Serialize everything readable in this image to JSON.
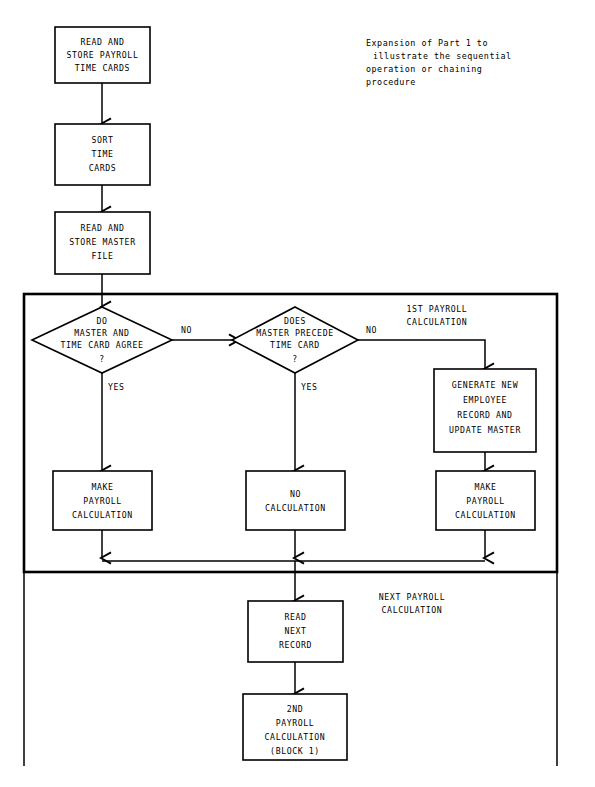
{
  "page": {
    "width": 595,
    "height": 787,
    "background_color": "#ffffff",
    "ink_color": "#000000"
  },
  "note": {
    "lines": [
      "Expansion of Part 1 to",
      "illustrate the sequential",
      "operation or chaining",
      "procedure"
    ]
  },
  "sections": [
    {
      "id": "first-payroll",
      "label_lines": [
        "1ST PAYROLL",
        "CALCULATION"
      ]
    },
    {
      "id": "next-payroll",
      "label_lines": [
        "NEXT PAYROLL",
        "CALCULATION"
      ]
    }
  ],
  "nodes": [
    {
      "id": "read-store-time-cards",
      "shape": "process",
      "lines": [
        "READ AND",
        "STORE PAYROLL",
        "TIME CARDS"
      ]
    },
    {
      "id": "sort-time-cards",
      "shape": "process",
      "lines": [
        "SORT",
        "TIME",
        "CARDS"
      ]
    },
    {
      "id": "read-store-master-file",
      "shape": "process",
      "lines": [
        "READ AND",
        "STORE MASTER",
        "FILE"
      ]
    },
    {
      "id": "master-time-card-agree",
      "shape": "decision",
      "lines": [
        "DO",
        "MASTER AND",
        "TIME CARD AGREE",
        "?"
      ]
    },
    {
      "id": "master-precede-time-card",
      "shape": "decision",
      "lines": [
        "DOES",
        "MASTER PRECEDE",
        "TIME CARD",
        "?"
      ]
    },
    {
      "id": "generate-new-employee-record",
      "shape": "process",
      "lines": [
        "GENERATE NEW",
        "EMPLOYEE",
        "RECORD AND",
        "UPDATE MASTER"
      ]
    },
    {
      "id": "make-payroll-calculation-left",
      "shape": "process",
      "lines": [
        "MAKE",
        "PAYROLL",
        "CALCULATION"
      ]
    },
    {
      "id": "no-calculation",
      "shape": "process",
      "lines": [
        "NO",
        "CALCULATION"
      ]
    },
    {
      "id": "make-payroll-calculation-right",
      "shape": "process",
      "lines": [
        "MAKE",
        "PAYROLL",
        "CALCULATION"
      ]
    },
    {
      "id": "read-next-record",
      "shape": "process",
      "lines": [
        "READ",
        "NEXT",
        "RECORD"
      ]
    },
    {
      "id": "second-payroll-calculation",
      "shape": "process",
      "lines": [
        "2ND",
        "PAYROLL",
        "CALCULATION",
        "(BLOCK 1)"
      ]
    }
  ],
  "edge_labels": {
    "agree_no": "NO",
    "agree_yes": "YES",
    "precede_no": "NO",
    "precede_yes": "YES"
  }
}
